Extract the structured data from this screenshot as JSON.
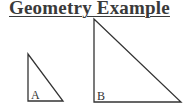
{
  "title": "Geometry Example",
  "triangles": [
    {
      "label": "A",
      "points": "28,54 28,101 63,101",
      "label_x": 31,
      "label_y": 99
    },
    {
      "label": "B",
      "points": "94,19 94,102 181,102",
      "label_x": 97,
      "label_y": 100
    }
  ],
  "colors": {
    "stroke": "#333333",
    "text": "#3a3a3a"
  }
}
